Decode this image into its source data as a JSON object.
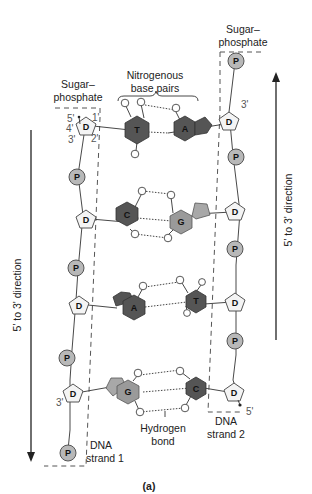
{
  "labels": {
    "sugar_phosphate_left": [
      "Sugar–",
      "phosphate"
    ],
    "sugar_phosphate_right": [
      "Sugar–",
      "phosphate"
    ],
    "nitrogenous_base_pairs": [
      "Nitrogenous",
      "base pairs"
    ],
    "hydrogen_bond": [
      "Hydrogen",
      "bond"
    ],
    "dna_strand_1": [
      "DNA",
      "strand 1"
    ],
    "dna_strand_2": [
      "DNA",
      "strand 2"
    ],
    "direction_left": "5' to 3' direction",
    "direction_right": "5' to 3' direction",
    "caption": "(a)"
  },
  "carbon_labels": {
    "c5": "5'",
    "c4": "4'",
    "c3": "3'",
    "c1": "1'",
    "c2": "2'",
    "right_top_3": "3'",
    "left_bottom_3": "3'",
    "right_bottom_5": "5'"
  },
  "symbols": {
    "phosphate": "P",
    "deoxyribose": "D"
  },
  "base_pairs": [
    {
      "left": "T",
      "right": "A"
    },
    {
      "left": "C",
      "right": "G"
    },
    {
      "left": "A",
      "right": "T"
    },
    {
      "left": "G",
      "right": "C"
    }
  ]
}
